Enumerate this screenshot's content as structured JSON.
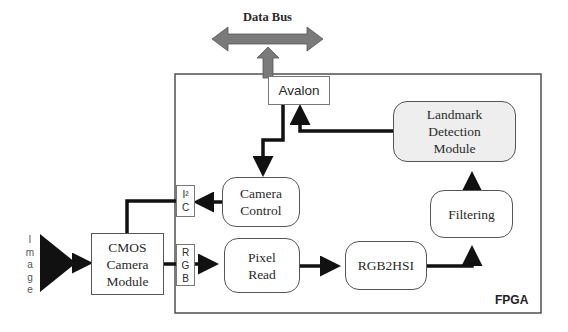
{
  "diagram": {
    "data_bus": {
      "label": "Data Bus",
      "color": "#777777"
    },
    "fpga": {
      "label": "FPGA"
    },
    "avalon": {
      "label": "Avalon"
    },
    "landmark": {
      "lines": [
        "Landmark",
        "Detection",
        "Module"
      ],
      "fill": "#eeeeee"
    },
    "camera_control": {
      "lines": [
        "Camera",
        "Control"
      ]
    },
    "filtering": {
      "label": "Filtering"
    },
    "pixel_read": {
      "lines": [
        "Pixel",
        "Read"
      ]
    },
    "rgb2hsi": {
      "label": "RGB2HSI"
    },
    "cmos": {
      "lines": [
        "CMOS",
        "Camera",
        "Module"
      ]
    },
    "i2c_port": {
      "lines": [
        "I²",
        "C"
      ]
    },
    "rgb_port": {
      "lines": [
        "R",
        "G",
        "B"
      ]
    },
    "image_input": {
      "letters": [
        "I",
        "m",
        "a",
        "g",
        "e"
      ]
    }
  }
}
